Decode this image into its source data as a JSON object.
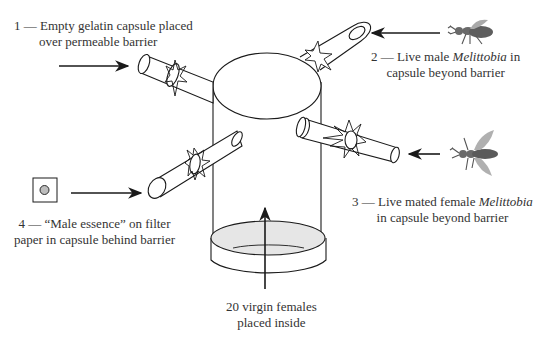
{
  "figure": {
    "type": "experimental apparatus diagram",
    "colors": {
      "line": "#1a1a1a",
      "dish_fill": "#e6e6e6",
      "essence_dot": "#bdbdbd",
      "insect_body": "#6a6a6a",
      "insect_wing": "#a9a9a9"
    }
  },
  "labels": {
    "capsule_1": {
      "number": "1",
      "line1": "1 — Empty gelatin capsule placed",
      "line2": "over permeable barrier"
    },
    "capsule_2": {
      "number": "2",
      "line1_pre": "2 — Live male ",
      "line1_italic": "Melittobia",
      "line1_post": " in",
      "line2": "capsule beyond barrier",
      "icon": "male-wasp-icon"
    },
    "capsule_3": {
      "number": "3",
      "line1_pre": "3 — Live mated female ",
      "line1_italic": "Melittobia",
      "line2": "in capsule beyond barrier",
      "icon": "female-wasp-icon"
    },
    "capsule_4": {
      "number": "4",
      "line1": "4 — “Male essence” on filter",
      "line2": "paper in capsule behind barrier",
      "icon": "filter-paper-icon"
    },
    "chamber": {
      "line1": "20 virgin females",
      "line2": "placed inside"
    }
  }
}
